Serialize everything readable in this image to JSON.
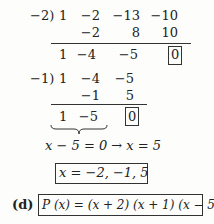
{
  "division1": {
    "divisor": "−2)",
    "row1": [
      "1",
      "−2",
      "−13",
      "−10"
    ],
    "row2": [
      "−2",
      "8",
      "10"
    ],
    "row3": [
      "1",
      "−4",
      "−5"
    ],
    "remainder": "0"
  },
  "division2": {
    "divisor": "−1)",
    "row1": [
      "1",
      "−4",
      "−5"
    ],
    "row2": [
      "−1",
      "5"
    ],
    "row3": [
      "1",
      "−5"
    ],
    "remainder": "0"
  },
  "equation": "x − 5 = 0  →  x = 5",
  "roots": "x = −2, −1,  5",
  "part_label": "(d)",
  "factored": "P (x) = (x + 2) (x + 1) (x − 5)"
}
